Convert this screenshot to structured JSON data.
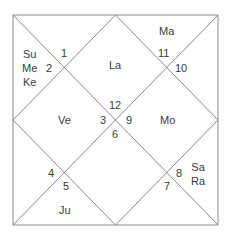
{
  "chart": {
    "style": "North Indian Kundli",
    "line_color": "#8a8a8a",
    "text_color": "#3a3a3a",
    "houses": [
      {
        "house": 1,
        "sign": "12",
        "planets": [
          "La"
        ]
      },
      {
        "house": 2,
        "sign": "11",
        "planets": [
          "Ma"
        ]
      },
      {
        "house": 3,
        "sign": "10",
        "planets": []
      },
      {
        "house": 4,
        "sign": "9",
        "planets": [
          "Mo"
        ]
      },
      {
        "house": 5,
        "sign": "8",
        "planets": [
          "Sa",
          "Ra"
        ]
      },
      {
        "house": 6,
        "sign": "7",
        "planets": []
      },
      {
        "house": 7,
        "sign": "6",
        "planets": []
      },
      {
        "house": 8,
        "sign": "5",
        "planets": [
          "Ju"
        ]
      },
      {
        "house": 9,
        "sign": "4",
        "planets": []
      },
      {
        "house": 10,
        "sign": "3",
        "planets": [
          "Ve"
        ]
      },
      {
        "house": 11,
        "sign": "2",
        "planets": [
          "Su",
          "Me",
          "Ke"
        ]
      },
      {
        "house": 12,
        "sign": "1",
        "planets": []
      }
    ]
  },
  "labels": {
    "la": "La",
    "ma": "Ma",
    "mo": "Mo",
    "sa": "Sa",
    "ra": "Ra",
    "ju": "Ju",
    "ve": "Ve",
    "su": "Su",
    "me": "Me",
    "ke": "Ke"
  },
  "numbers": {
    "n1": "1",
    "n2": "2",
    "n3": "3",
    "n4": "4",
    "n5": "5",
    "n6": "6",
    "n7": "7",
    "n8": "8",
    "n9": "9",
    "n10": "10",
    "n11": "11",
    "n12": "12"
  }
}
